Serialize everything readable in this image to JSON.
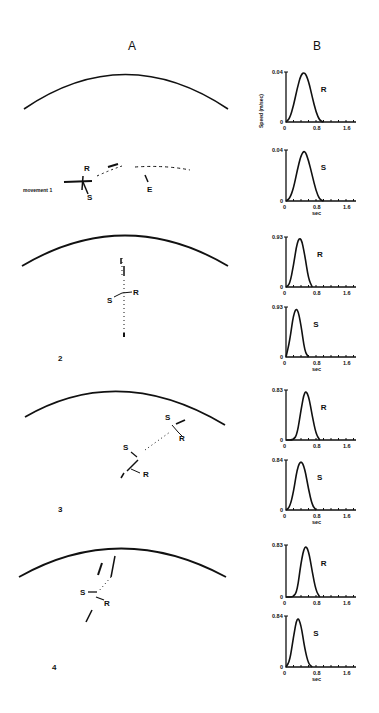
{
  "figure": {
    "panel_a_label": "A",
    "panel_b_label": "B",
    "y_axis_label": "Speed (m/sec)",
    "x_axis_label": "sec",
    "movements": [
      {
        "label": "movement 1",
        "markers": [
          "R",
          "S",
          "E"
        ]
      },
      {
        "label": "2",
        "markers": [
          "S",
          "R"
        ]
      },
      {
        "label": "3",
        "markers": [
          "S",
          "R",
          "S",
          "R"
        ]
      },
      {
        "label": "4",
        "markers": [
          "S",
          "R"
        ]
      }
    ]
  },
  "chart_data": [
    {
      "type": "line",
      "movement": 1,
      "series": "R",
      "ymax_label": "0.04",
      "yzero_label": "0",
      "x_ticks": [
        "0",
        "0.8",
        "1.6"
      ],
      "xlabel": "",
      "ylabel": "Speed (m/sec)",
      "ylim": [
        0,
        0.04
      ],
      "xlim": [
        0,
        1.6
      ],
      "x": [
        0,
        0.1,
        0.2,
        0.3,
        0.4,
        0.5,
        0.6,
        0.7,
        0.8,
        0.9,
        1.0
      ],
      "values": [
        0,
        0.003,
        0.013,
        0.027,
        0.038,
        0.04,
        0.033,
        0.02,
        0.008,
        0.001,
        0
      ]
    },
    {
      "type": "line",
      "movement": 1,
      "series": "S",
      "ymax_label": "0.04",
      "yzero_label": "0",
      "x_ticks": [
        "0",
        "0.8",
        "1.6"
      ],
      "xlabel": "sec",
      "ylabel": "",
      "ylim": [
        0,
        0.04
      ],
      "xlim": [
        0,
        1.6
      ],
      "x": [
        0,
        0.1,
        0.2,
        0.3,
        0.4,
        0.5,
        0.6,
        0.7,
        0.8,
        0.9,
        1.0
      ],
      "values": [
        0,
        0.002,
        0.01,
        0.024,
        0.036,
        0.04,
        0.032,
        0.02,
        0.008,
        0.001,
        0
      ]
    },
    {
      "type": "line",
      "movement": 2,
      "series": "R",
      "ymax_label": "0.93",
      "yzero_label": "0",
      "x_ticks": [
        "0",
        "0.8",
        "1.6"
      ],
      "xlabel": "",
      "ylabel": "",
      "ylim": [
        0,
        0.93
      ],
      "xlim": [
        0,
        1.6
      ],
      "x": [
        0,
        0.1,
        0.2,
        0.3,
        0.4,
        0.5,
        0.6,
        0.7
      ],
      "values": [
        0,
        0.05,
        0.4,
        0.85,
        0.93,
        0.6,
        0.15,
        0
      ]
    },
    {
      "type": "line",
      "movement": 2,
      "series": "S",
      "ymax_label": "0.93",
      "yzero_label": "0",
      "x_ticks": [
        "0",
        "0.8",
        "1.6"
      ],
      "xlabel": "sec",
      "ylabel": "",
      "ylim": [
        0,
        0.93
      ],
      "xlim": [
        0,
        1.6
      ],
      "x": [
        0,
        0.1,
        0.2,
        0.3,
        0.4,
        0.5,
        0.6
      ],
      "values": [
        0,
        0.3,
        0.8,
        0.93,
        0.6,
        0.1,
        0
      ]
    },
    {
      "type": "line",
      "movement": 3,
      "series": "R",
      "ymax_label": "0.83",
      "yzero_label": "0",
      "x_ticks": [
        "0",
        "0.8",
        "1.6"
      ],
      "xlabel": "",
      "ylabel": "",
      "ylim": [
        0,
        0.83
      ],
      "xlim": [
        0,
        1.6
      ],
      "x": [
        0,
        0.2,
        0.3,
        0.4,
        0.5,
        0.6,
        0.7,
        0.8,
        0.9
      ],
      "values": [
        0,
        0,
        0.1,
        0.5,
        0.83,
        0.75,
        0.4,
        0.1,
        0
      ]
    },
    {
      "type": "line",
      "movement": 3,
      "series": "S",
      "ymax_label": "0.84",
      "yzero_label": "0",
      "x_ticks": [
        "0",
        "0.8",
        "1.6"
      ],
      "xlabel": "sec",
      "ylabel": "",
      "ylim": [
        0,
        0.84
      ],
      "xlim": [
        0,
        1.6
      ],
      "x": [
        0,
        0.1,
        0.2,
        0.3,
        0.4,
        0.5,
        0.6,
        0.7,
        0.8
      ],
      "values": [
        0,
        0.05,
        0.3,
        0.7,
        0.84,
        0.7,
        0.35,
        0.08,
        0
      ]
    },
    {
      "type": "line",
      "movement": 4,
      "series": "R",
      "ymax_label": "0.83",
      "yzero_label": "0",
      "x_ticks": [
        "0",
        "0.8",
        "1.6"
      ],
      "xlabel": "",
      "ylabel": "",
      "ylim": [
        0,
        0.83
      ],
      "xlim": [
        0,
        1.6
      ],
      "x": [
        0,
        0.2,
        0.3,
        0.4,
        0.5,
        0.6,
        0.7,
        0.8,
        0.9
      ],
      "values": [
        0,
        0,
        0.1,
        0.55,
        0.83,
        0.75,
        0.4,
        0.1,
        0
      ]
    },
    {
      "type": "line",
      "movement": 4,
      "series": "S",
      "ymax_label": "0.84",
      "yzero_label": "0",
      "x_ticks": [
        "0",
        "0.8",
        "1.6"
      ],
      "xlabel": "sec",
      "ylabel": "",
      "ylim": [
        0,
        0.84
      ],
      "xlim": [
        0,
        1.6
      ],
      "x": [
        0,
        0.1,
        0.2,
        0.3,
        0.4,
        0.5,
        0.6,
        0.7
      ],
      "values": [
        0,
        0.1,
        0.5,
        0.84,
        0.7,
        0.3,
        0.05,
        0
      ]
    }
  ]
}
